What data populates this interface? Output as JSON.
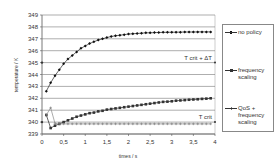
{
  "chart_data": {
    "type": "line",
    "title": "",
    "xlabel": "times / s",
    "ylabel": "temperature / K",
    "xlim": [
      0,
      4
    ],
    "ylim": [
      339,
      349
    ],
    "x_ticks": [
      "0",
      "0,5",
      "1",
      "1,5",
      "2",
      "2,5",
      "3",
      "3,5",
      "4"
    ],
    "y_ticks": [
      "339",
      "340",
      "341",
      "342",
      "343",
      "344",
      "345",
      "346",
      "347",
      "348",
      "349"
    ],
    "grid": "horizontal",
    "legend_position": "right",
    "annotations": [
      {
        "text": "T crit + ΔT",
        "y": 345
      },
      {
        "text": "T crit",
        "y": 340
      }
    ],
    "x": [
      0.1,
      0.2,
      0.3,
      0.4,
      0.5,
      0.6,
      0.7,
      0.8,
      0.9,
      1.0,
      1.1,
      1.2,
      1.3,
      1.4,
      1.5,
      1.6,
      1.7,
      1.8,
      1.9,
      2.0,
      2.1,
      2.2,
      2.3,
      2.4,
      2.5,
      2.6,
      2.7,
      2.8,
      2.9,
      3.0,
      3.1,
      3.2,
      3.3,
      3.4,
      3.5,
      3.6,
      3.7,
      3.8,
      3.9
    ],
    "series": [
      {
        "name": "no policy",
        "marker": "diamond",
        "values": [
          342.6,
          343.3,
          343.9,
          344.4,
          344.9,
          345.3,
          345.6,
          345.9,
          346.2,
          346.4,
          346.6,
          346.75,
          346.9,
          347.0,
          347.1,
          347.2,
          347.25,
          347.3,
          347.35,
          347.4,
          347.42,
          347.45,
          347.47,
          347.5,
          347.5,
          347.52,
          347.53,
          347.54,
          347.55,
          347.55,
          347.56,
          347.56,
          347.57,
          347.57,
          347.57,
          347.58,
          347.58,
          347.58,
          347.58
        ]
      },
      {
        "name": "frequency scaling",
        "marker": "square",
        "values": [
          340.6,
          339.5,
          339.7,
          339.85,
          340.0,
          340.15,
          340.3,
          340.45,
          340.55,
          340.65,
          340.75,
          340.8,
          340.9,
          340.95,
          341.05,
          341.1,
          341.15,
          341.2,
          341.25,
          341.3,
          341.35,
          341.4,
          341.45,
          341.5,
          341.55,
          341.6,
          341.65,
          341.7,
          341.72,
          341.75,
          341.8,
          341.82,
          341.85,
          341.88,
          341.9,
          341.92,
          341.95,
          341.97,
          342.0
        ]
      },
      {
        "name": "QoS + frequency scaling",
        "marker": "cross",
        "values": [
          340.6,
          341.2,
          339.9,
          339.85,
          339.85,
          339.85,
          339.85,
          339.85,
          339.85,
          339.85,
          339.85,
          339.85,
          339.85,
          339.85,
          339.85,
          339.85,
          339.85,
          339.85,
          339.85,
          339.85,
          339.85,
          339.85,
          339.85,
          339.85,
          339.85,
          339.85,
          339.85,
          339.85,
          339.85,
          339.85,
          339.85,
          339.85,
          339.85,
          339.85,
          339.85,
          339.85,
          339.85,
          339.85,
          339.85
        ]
      }
    ]
  },
  "legend": {
    "items": [
      {
        "label": "no policy"
      },
      {
        "label": "frequency scaling"
      },
      {
        "label": "QoS + frequency scaling"
      }
    ]
  }
}
